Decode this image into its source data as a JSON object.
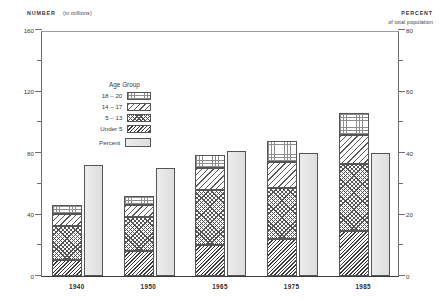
{
  "axis_captions": {
    "left_bold": "NUMBER",
    "left_normal": "(in millions)",
    "right_bold": "PERCENT",
    "right_normal": "of total population"
  },
  "legend": {
    "title": "Age Group",
    "items": [
      {
        "label": "18 – 20",
        "swatch": "dotted-grid-pattern"
      },
      {
        "label": "14 – 17",
        "swatch": "diagonal-hatch-pattern"
      },
      {
        "label": "5 – 13",
        "swatch": "crosshatch-pattern"
      },
      {
        "label": "Under 5",
        "swatch": "dense-diagonal-pattern"
      }
    ],
    "percent_label": "Percent",
    "percent_swatch": "solid-gray-pattern"
  },
  "chart_data": {
    "type": "bar",
    "title": "",
    "subtype": "stacked-bar-with-secondary-axis",
    "xlabel": "",
    "ylabel": "NUMBER (in millions)",
    "y2label": "PERCENT of total population",
    "categories": [
      "1940",
      "1950",
      "1965",
      "1975",
      "1985"
    ],
    "ylim": [
      0,
      160
    ],
    "y_ticks_major": [
      0,
      40,
      80,
      120,
      160
    ],
    "y_ticks_minor": [
      20,
      60,
      100,
      140
    ],
    "y2lim": [
      0,
      80
    ],
    "y2_ticks_major": [
      0,
      20,
      40,
      60,
      80
    ],
    "y2_ticks_minor": [
      10,
      30,
      50,
      70
    ],
    "grid": false,
    "legend_position": "upper-left-inside",
    "series": [
      {
        "name": "Under 5",
        "axis": "left",
        "values": [
          10.5,
          16.5,
          20.0,
          24.0,
          29.0
        ]
      },
      {
        "name": "5 – 13",
        "axis": "left",
        "values": [
          22.0,
          22.0,
          36.0,
          33.0,
          44.0
        ]
      },
      {
        "name": "14 – 17",
        "axis": "left",
        "values": [
          8.0,
          8.0,
          14.0,
          17.0,
          19.0
        ]
      },
      {
        "name": "18 – 20",
        "axis": "left",
        "values": [
          6.0,
          5.5,
          9.0,
          14.0,
          14.0
        ]
      }
    ],
    "totals": [
      46.5,
      52.0,
      79.0,
      88.0,
      106.0
    ],
    "percent_series": {
      "name": "Percent",
      "axis": "right",
      "values": [
        36.0,
        35.0,
        40.5,
        40.0,
        40.0
      ]
    }
  }
}
